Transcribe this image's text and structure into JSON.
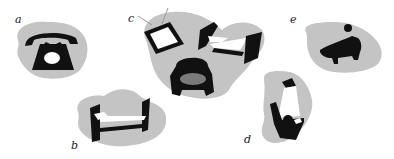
{
  "figure": {
    "colors": {
      "blob": "#c4c4c4",
      "ink": "#111111",
      "seat": "#7a7a7a",
      "background": "#ffffff"
    },
    "panels": [
      {
        "id": "a",
        "label": "a",
        "objects": [
          "telephone"
        ]
      },
      {
        "id": "b",
        "label": "b",
        "objects": [
          "bed"
        ]
      },
      {
        "id": "c",
        "label": "c",
        "objects": [
          "television",
          "bed",
          "armchair"
        ]
      },
      {
        "id": "d",
        "label": "d",
        "objects": [
          "lamp",
          "person-in-chair"
        ]
      },
      {
        "id": "e",
        "label": "e",
        "objects": [
          "bathtub-with-person"
        ]
      }
    ]
  }
}
